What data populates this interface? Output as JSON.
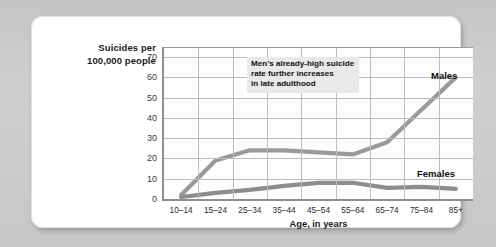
{
  "figure": {
    "ylabel_line1": "Suicides per",
    "ylabel_line2": "100,000 people",
    "xlabel": "Age, in years",
    "annotation_line1": "Men’s already-high suicide",
    "annotation_line2": "rate further increases",
    "annotation_line3": "in late adulthood",
    "series_label_males": "Males",
    "series_label_females": "Females",
    "colors": {
      "males_line": "#9a9a9a",
      "females_line": "#8d8d8d",
      "grid": "#bdbdbd",
      "axis": "#8e8e8e",
      "plot_background": "#fdfdfd",
      "card_background": "#ffffff",
      "page_background": "#cbcac8",
      "annotation_background": "#e9e9e7",
      "text": "#111111"
    }
  },
  "chart_data": {
    "type": "line",
    "title": "",
    "xlabel": "Age, in years",
    "ylabel": "Suicides per 100,000 people",
    "categories": [
      "10–14",
      "15–24",
      "25–34",
      "35–44",
      "45–54",
      "55–64",
      "65–74",
      "75–84",
      "85+"
    ],
    "ylim": [
      0,
      75
    ],
    "yticks": [
      0,
      10,
      20,
      30,
      40,
      50,
      60,
      70
    ],
    "ytick_labels": [
      "0",
      "10",
      "20",
      "30",
      "40",
      "50",
      "60",
      "70"
    ],
    "grid": true,
    "legend_position": "inline-labels",
    "annotations": [
      {
        "text": "Men’s already-high suicide rate further increases in late adulthood",
        "target_series": "Males"
      }
    ],
    "series": [
      {
        "name": "Males",
        "values": [
          2,
          19,
          24,
          24,
          23,
          22,
          28,
          44,
          60
        ]
      },
      {
        "name": "Females",
        "values": [
          1,
          3,
          4.5,
          6.5,
          8,
          8,
          5.5,
          6,
          5
        ]
      }
    ]
  }
}
